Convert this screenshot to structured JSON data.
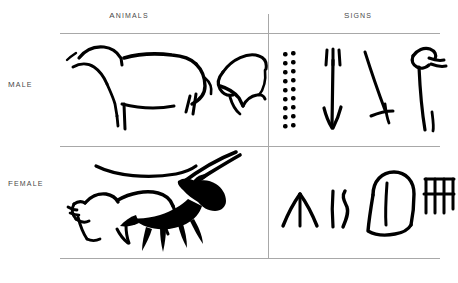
{
  "figure": {
    "columns": [
      {
        "id": "animals",
        "label": "Animals"
      },
      {
        "id": "signs",
        "label": "Signs"
      }
    ],
    "rows": [
      {
        "id": "male",
        "label": "Male"
      },
      {
        "id": "female",
        "label": "Female"
      }
    ],
    "colors": {
      "ink": "#000000",
      "rule": "#a8a8a8",
      "label_text": "#4a4a4a",
      "background": "#ffffff"
    },
    "cells": {
      "male_animals": {
        "name": "male-animals-cell",
        "motifs": [
          {
            "id": "bison-outline",
            "label": "bison outline in profile"
          },
          {
            "id": "bison-head-outline",
            "label": "bison head outline"
          }
        ]
      },
      "male_signs": {
        "name": "male-signs-cell",
        "motifs": [
          {
            "id": "paired-dots-column",
            "label": "double column of dots",
            "rows": 9
          },
          {
            "id": "barbed-arrow-sign",
            "label": "barbed arrow sign"
          },
          {
            "id": "oblique-barbed-line",
            "label": "oblique barbed line"
          },
          {
            "id": "hooked-staff-sign",
            "label": "hooked staff sign"
          }
        ]
      },
      "female_animals": {
        "name": "female-animals-cell",
        "motifs": [
          {
            "id": "curved-arc",
            "label": "curved arc line"
          },
          {
            "id": "bison-outline",
            "label": "bison outline"
          },
          {
            "id": "ibex-filled",
            "label": "filled ibex with long horns"
          }
        ]
      },
      "female_signs": {
        "name": "female-signs-cell",
        "motifs": [
          {
            "id": "chevron-sign",
            "label": "chevron sign"
          },
          {
            "id": "paired-strokes-sign",
            "label": "paired vertical strokes"
          },
          {
            "id": "tectiform-sign",
            "label": "rounded tectiform sign"
          },
          {
            "id": "grid-sign",
            "label": "grid sign"
          }
        ]
      }
    }
  }
}
